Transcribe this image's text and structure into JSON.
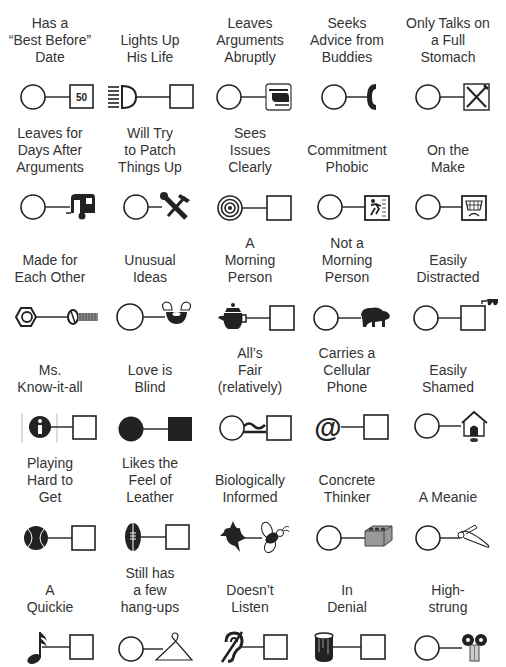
{
  "rows": [
    [
      {
        "label": "Has a\n“Best Before”\nDate",
        "left": "circle",
        "right": "square-50",
        "right_text": "50"
      },
      {
        "label": "Lights Up\nHis Life",
        "left": "headlight-icon",
        "right": "square"
      },
      {
        "label": "Leaves\nArguments\nAbruptly",
        "left": "circle",
        "right": "helicopter-icon"
      },
      {
        "label": "Seeks\nAdvice from\nBuddies",
        "left": "circle",
        "right": "telephone-icon"
      },
      {
        "label": "Only Talks on\na Full\nStomach",
        "left": "circle",
        "right": "restaurant-icon"
      }
    ],
    [
      {
        "label": "Leaves for\nDays After\nArguments",
        "left": "circle",
        "right": "camper-trailer-icon"
      },
      {
        "label": "Will Try\nto Patch\nThings Up",
        "left": "circle",
        "right": "tools-icon"
      },
      {
        "label": "Sees\nIssues\nClearly",
        "left": "target-icon",
        "right": "square"
      },
      {
        "label": "Commitment\nPhobic",
        "left": "circle",
        "right": "running-exit-icon"
      },
      {
        "label": "On the\nMake",
        "left": "circle",
        "right": "shopping-cart-icon"
      }
    ],
    [
      {
        "label": "Made for\nEach Other",
        "left": "hex-nut-icon",
        "right": "bolt-icon"
      },
      {
        "label": "Unusual\nIdeas",
        "left": "circle",
        "right": "wing-nut-icon"
      },
      {
        "label": "A\nMorning\nPerson",
        "left": "teapot-icon",
        "right": "square"
      },
      {
        "label": "Not a\nMorning\nPerson",
        "left": "circle",
        "right": "bear-icon"
      },
      {
        "label": "Easily\nDistracted",
        "left": "circle",
        "right": "square-with-glasses-icon"
      }
    ],
    [
      {
        "label": "Ms.\nKnow-it-all",
        "left": "info-icon",
        "right": "square"
      },
      {
        "label": "Love is\nBlind",
        "left": "filled-circle",
        "right": "filled-square"
      },
      {
        "label": "All’s\nFair\n(relatively)",
        "left": "circle",
        "right": "square",
        "connector": "approx-equal"
      },
      {
        "label": "Carries a\nCellular\nPhone",
        "left": "at-sign-icon",
        "right": "square"
      },
      {
        "label": "Easily\nShamed",
        "left": "circle",
        "right": "doghouse-icon"
      }
    ],
    [
      {
        "label": "Playing\nHard to\nGet",
        "left": "tennis-ball-icon",
        "right": "square"
      },
      {
        "label": "Likes the\nFeel of\nLeather",
        "left": "football-icon",
        "right": "square"
      },
      {
        "label": "Biologically\nInformed",
        "left": "bird-icon",
        "right": "bee-icon"
      },
      {
        "label": "Concrete\nThinker",
        "left": "circle",
        "right": "cinder-block-icon"
      },
      {
        "label": "A Meanie",
        "left": "circle",
        "right": "safety-pin-icon"
      }
    ],
    [
      {
        "label": "A\nQuickie",
        "left": "music-note-icon",
        "right": "square"
      },
      {
        "label": "Still has\na few\nhang-ups",
        "left": "circle",
        "right": "coat-hanger-icon"
      },
      {
        "label": "Doesn’t\nListen",
        "left": "hearing-impaired-icon",
        "right": "square"
      },
      {
        "label": "In\nDenial",
        "left": "paint-can-icon",
        "right": "square"
      },
      {
        "label": "High-\nstrung",
        "left": "circle",
        "right": "wind-up-key-icon"
      }
    ]
  ]
}
